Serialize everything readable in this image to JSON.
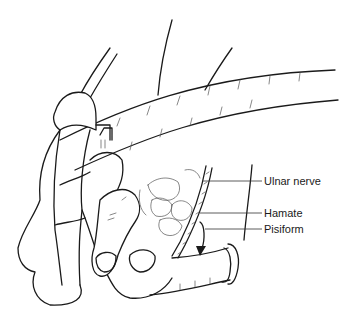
{
  "figure": {
    "labels": [
      {
        "id": "ulnar-nerve",
        "text": "Ulnar nerve",
        "x": 264,
        "y": 175,
        "leader_from_x": 203,
        "leader_y": 181
      },
      {
        "id": "hamate",
        "text": "Hamate",
        "x": 264,
        "y": 207,
        "leader_from_x": 200,
        "leader_y": 213
      },
      {
        "id": "pisiform",
        "text": "Pisiform",
        "x": 264,
        "y": 223,
        "leader_from_x": 205,
        "leader_y": 229
      }
    ],
    "colors": {
      "line": "#1a1a1a",
      "background": "#ffffff"
    }
  }
}
